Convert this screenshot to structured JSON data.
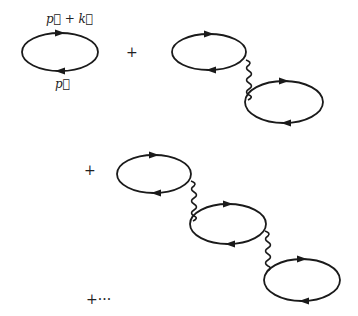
{
  "colors": {
    "line": "#1a1a1a",
    "text": "#222222",
    "background": "#ffffff"
  },
  "labels": {
    "upper_momentum": "p⃗ + k⃗",
    "lower_momentum": "p⃗"
  },
  "operators": {
    "plus_1": "+",
    "plus_2": "+",
    "plus_ellipsis": "+···"
  },
  "terms": [
    {
      "name": "one-loop",
      "loops": 1,
      "photon_lines": 0
    },
    {
      "name": "two-loop-chain",
      "loops": 2,
      "photon_lines": 1
    },
    {
      "name": "three-loop-chain",
      "loops": 3,
      "photon_lines": 2
    }
  ]
}
